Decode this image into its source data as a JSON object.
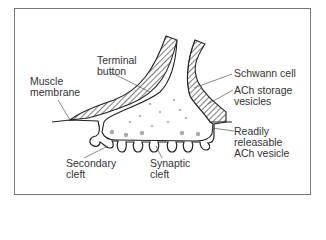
{
  "diagram": {
    "labels": {
      "terminal_button": "Terminal\nbutton",
      "muscle_membrane": "Muscle\nmembrane",
      "schwann_cell": "Schwann cell",
      "ach_storage": "ACh storage\nvesicles",
      "readily_releasable": "Readily\nreleasable\nACh vesicle",
      "secondary_cleft": "Secondary\ncleft",
      "synaptic_cleft": "Synaptic\ncleft"
    }
  }
}
